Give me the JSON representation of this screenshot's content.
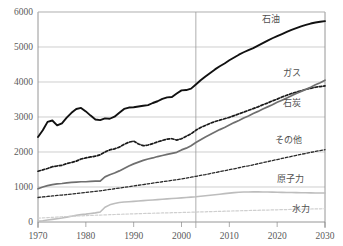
{
  "figure": {
    "top_caption": "",
    "vertical_divider_year": 2003
  },
  "chart_data": {
    "type": "line",
    "title": "",
    "xlabel": "",
    "ylabel": "",
    "xlim": [
      1970,
      2030
    ],
    "ylim": [
      0,
      6000
    ],
    "grid": true,
    "legend_position": "right-inline",
    "xticks": [
      "1970",
      "1980",
      "1990",
      "2000",
      "2010",
      "2020",
      "2030"
    ],
    "yticks": [
      "0",
      "1000",
      "2000",
      "3000",
      "4000",
      "5000",
      "6000"
    ],
    "annotations": [
      {
        "text": "2003",
        "type": "vertical-divider",
        "x": 2003
      }
    ],
    "x": [
      1970,
      1971,
      1972,
      1973,
      1974,
      1975,
      1976,
      1977,
      1978,
      1979,
      1980,
      1981,
      1982,
      1983,
      1984,
      1985,
      1986,
      1987,
      1988,
      1989,
      1990,
      1991,
      1992,
      1993,
      1994,
      1995,
      1996,
      1997,
      1998,
      1999,
      2000,
      2001,
      2002,
      2003,
      2004,
      2005,
      2006,
      2007,
      2008,
      2009,
      2010,
      2011,
      2012,
      2013,
      2014,
      2015,
      2016,
      2017,
      2018,
      2019,
      2020,
      2021,
      2022,
      2023,
      2024,
      2025,
      2026,
      2027,
      2028,
      2029,
      2030
    ],
    "series": [
      {
        "name": "石油",
        "name_en": "oil",
        "color": "#111111",
        "style": "solid",
        "width": 1.9,
        "label": "石油",
        "values": [
          2430,
          2620,
          2860,
          2900,
          2760,
          2820,
          2980,
          3120,
          3230,
          3260,
          3160,
          3040,
          2930,
          2910,
          2960,
          2950,
          3010,
          3120,
          3230,
          3270,
          3280,
          3300,
          3320,
          3340,
          3400,
          3450,
          3520,
          3560,
          3570,
          3670,
          3760,
          3770,
          3810,
          3930,
          4050,
          4160,
          4260,
          4360,
          4450,
          4530,
          4620,
          4700,
          4780,
          4850,
          4910,
          4970,
          5040,
          5110,
          5180,
          5250,
          5310,
          5370,
          5430,
          5490,
          5540,
          5590,
          5630,
          5670,
          5700,
          5720,
          5740
        ]
      },
      {
        "name": "石炭",
        "name_en": "coal",
        "color": "#1a1a1a",
        "style": "dashed",
        "width": 1.7,
        "label": "石炭",
        "values": [
          1450,
          1490,
          1530,
          1580,
          1600,
          1620,
          1670,
          1700,
          1740,
          1800,
          1830,
          1860,
          1880,
          1920,
          2000,
          2060,
          2090,
          2140,
          2220,
          2280,
          2310,
          2230,
          2180,
          2200,
          2240,
          2290,
          2330,
          2370,
          2380,
          2340,
          2380,
          2450,
          2520,
          2620,
          2700,
          2760,
          2820,
          2870,
          2910,
          2950,
          2990,
          3040,
          3090,
          3140,
          3190,
          3240,
          3290,
          3350,
          3400,
          3460,
          3510,
          3570,
          3620,
          3670,
          3710,
          3750,
          3790,
          3820,
          3850,
          3870,
          3890
        ]
      },
      {
        "name": "ガス",
        "name_en": "gas",
        "color": "#6f6f6f",
        "style": "solid",
        "width": 1.7,
        "label": "ガス",
        "values": [
          950,
          1000,
          1040,
          1070,
          1090,
          1100,
          1120,
          1130,
          1140,
          1150,
          1150,
          1160,
          1165,
          1170,
          1290,
          1350,
          1400,
          1460,
          1530,
          1600,
          1660,
          1710,
          1760,
          1800,
          1830,
          1870,
          1900,
          1930,
          1960,
          1990,
          2060,
          2110,
          2180,
          2270,
          2350,
          2430,
          2500,
          2570,
          2640,
          2700,
          2770,
          2840,
          2900,
          2970,
          3030,
          3100,
          3160,
          3230,
          3290,
          3350,
          3420,
          3480,
          3540,
          3610,
          3670,
          3730,
          3790,
          3850,
          3920,
          3980,
          4050
        ]
      },
      {
        "name": "その他",
        "name_en": "others",
        "color": "#2a2a2a",
        "style": "dashed",
        "width": 1.3,
        "label": "その他",
        "values": [
          700,
          715,
          730,
          745,
          760,
          770,
          785,
          800,
          815,
          830,
          845,
          860,
          875,
          890,
          910,
          930,
          950,
          970,
          990,
          1010,
          1030,
          1050,
          1070,
          1090,
          1110,
          1130,
          1150,
          1170,
          1190,
          1210,
          1230,
          1255,
          1280,
          1305,
          1330,
          1355,
          1385,
          1410,
          1440,
          1465,
          1495,
          1520,
          1550,
          1580,
          1605,
          1635,
          1665,
          1695,
          1725,
          1755,
          1785,
          1815,
          1845,
          1875,
          1905,
          1935,
          1960,
          1990,
          2015,
          2040,
          2065
        ]
      },
      {
        "name": "原子力",
        "name_en": "nuclear",
        "color": "#bdbdbd",
        "style": "solid",
        "width": 1.6,
        "label": "原子力",
        "values": [
          20,
          35,
          55,
          75,
          95,
          115,
          140,
          165,
          190,
          210,
          225,
          245,
          260,
          285,
          420,
          490,
          530,
          555,
          570,
          580,
          590,
          600,
          610,
          620,
          630,
          640,
          650,
          660,
          670,
          680,
          690,
          700,
          710,
          720,
          735,
          750,
          765,
          780,
          795,
          810,
          825,
          838,
          848,
          855,
          858,
          860,
          860,
          858,
          856,
          853,
          850,
          847,
          844,
          841,
          838,
          836,
          834,
          832,
          830,
          829,
          828
        ]
      },
      {
        "name": "水力",
        "name_en": "hydro",
        "color": "#cfcfcf",
        "style": "dashed",
        "width": 1.2,
        "label": "水力",
        "values": [
          110,
          118,
          126,
          134,
          142,
          150,
          157,
          164,
          170,
          176,
          182,
          188,
          193,
          198,
          204,
          209,
          214,
          219,
          224,
          229,
          234,
          238,
          242,
          246,
          250,
          254,
          258,
          261,
          265,
          268,
          272,
          276,
          280,
          284,
          288,
          292,
          296,
          300,
          304,
          308,
          312,
          316,
          320,
          324,
          328,
          331,
          335,
          339,
          342,
          346,
          349,
          353,
          356,
          360,
          363,
          366,
          369,
          372,
          375,
          377,
          380
        ]
      }
    ]
  }
}
